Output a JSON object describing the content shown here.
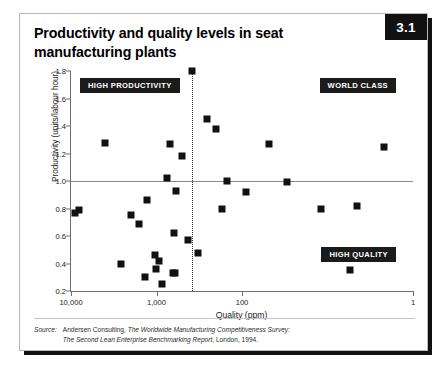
{
  "figure": {
    "number": "3.1",
    "title": "Productivity and quality levels in seat manufacturing plants"
  },
  "source": {
    "label": "Source:",
    "line1_plain_a": "Andersen Consulting, ",
    "line1_italic": "The Worldwide Manufacturing Competitiveness Survey:",
    "line2_italic": "The Second Lean Enterprise Benchmarking Report",
    "line2_plain": ", London, 1994."
  },
  "callouts": {
    "high_productivity": "HIGH PRODUCTIVITY",
    "world_class": "WORLD CLASS",
    "high_quality": "HIGH QUALITY"
  },
  "chart_data": {
    "type": "scatter",
    "title": "Productivity and quality levels in seat manufacturing plants",
    "xlabel": "Quality (ppm)",
    "ylabel": "Productivity (units/labour hour)",
    "x_scale": "log-reversed",
    "xlim": [
      10000,
      1
    ],
    "xticks": [
      10000,
      1000,
      100,
      1
    ],
    "xtick_labels": [
      "10,000",
      "1,000",
      "100",
      "1"
    ],
    "ylim": [
      0.2,
      1.8
    ],
    "yticks": [
      0.2,
      0.4,
      0.6,
      0.8,
      1.0,
      1.2,
      1.4,
      1.6,
      1.8
    ],
    "ytick_labels": [
      "0.2",
      "0.4",
      "0.6",
      "0.8",
      "1.0",
      "1.2",
      "1.4",
      "1.6",
      "1.8"
    ],
    "grid": false,
    "legend": "none",
    "reference_lines": [
      {
        "orientation": "horizontal",
        "value": 1.0,
        "style": "solid"
      },
      {
        "orientation": "vertical",
        "value": 380,
        "style": "dotted"
      }
    ],
    "annotations": [
      {
        "text": "HIGH PRODUCTIVITY",
        "quadrant": "top-left"
      },
      {
        "text": "WORLD CLASS",
        "quadrant": "top-right"
      },
      {
        "text": "HIGH QUALITY",
        "quadrant": "bottom-right"
      }
    ],
    "points": [
      {
        "x": 380,
        "y": 1.8
      },
      {
        "x": 260,
        "y": 1.45
      },
      {
        "x": 200,
        "y": 1.38
      },
      {
        "x": 4000,
        "y": 1.28
      },
      {
        "x": 700,
        "y": 1.27
      },
      {
        "x": 48,
        "y": 1.27
      },
      {
        "x": 2.2,
        "y": 1.25
      },
      {
        "x": 500,
        "y": 1.18
      },
      {
        "x": 760,
        "y": 1.02
      },
      {
        "x": 150,
        "y": 1.0
      },
      {
        "x": 30,
        "y": 0.99
      },
      {
        "x": 8000,
        "y": 0.79
      },
      {
        "x": 9000,
        "y": 0.77
      },
      {
        "x": 590,
        "y": 0.93
      },
      {
        "x": 90,
        "y": 0.92
      },
      {
        "x": 1300,
        "y": 0.86
      },
      {
        "x": 170,
        "y": 0.8
      },
      {
        "x": 2000,
        "y": 0.75
      },
      {
        "x": 1600,
        "y": 0.69
      },
      {
        "x": 4.5,
        "y": 0.82
      },
      {
        "x": 12,
        "y": 0.8
      },
      {
        "x": 620,
        "y": 0.62
      },
      {
        "x": 430,
        "y": 0.57
      },
      {
        "x": 330,
        "y": 0.48
      },
      {
        "x": 1050,
        "y": 0.46
      },
      {
        "x": 930,
        "y": 0.42
      },
      {
        "x": 2600,
        "y": 0.4
      },
      {
        "x": 1020,
        "y": 0.36
      },
      {
        "x": 5.5,
        "y": 0.35
      },
      {
        "x": 640,
        "y": 0.33
      },
      {
        "x": 600,
        "y": 0.33
      },
      {
        "x": 1350,
        "y": 0.3
      },
      {
        "x": 870,
        "y": 0.25
      }
    ]
  }
}
